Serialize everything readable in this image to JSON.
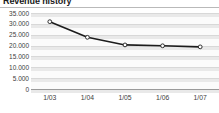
{
  "widget": {
    "title": "Revenue history"
  },
  "chart_data": {
    "type": "line",
    "title": "Revenue history",
    "xlabel": "",
    "ylabel": "",
    "categories": [
      "1/03",
      "1/04",
      "1/05",
      "1/06",
      "1/07"
    ],
    "values": [
      31000,
      23800,
      20300,
      19900,
      19400
    ],
    "series": [
      {
        "name": "Revenue",
        "values": [
          31000,
          23800,
          20300,
          19900,
          19400
        ],
        "line_color": "#1c1c1c",
        "marker": "circle",
        "marker_fill": "#ffffff",
        "marker_edge": "#1c1c1c"
      }
    ],
    "ylim": [
      0,
      35000
    ],
    "ytick_values": [
      35000,
      30000,
      25000,
      20000,
      15000,
      10000,
      5000,
      0
    ],
    "ytick_labels": [
      "35.000",
      "30.000",
      "25.000",
      "20.000",
      "15.000",
      "10.000",
      "5.000",
      "0"
    ],
    "xtick_labels": [
      "1/03",
      "1/04",
      "1/05",
      "1/06",
      "1/07"
    ],
    "grid": true,
    "grid_style": "horizontal-banded",
    "legend": false,
    "plot_background": "#fbfbfb",
    "grid_color": "#e9e9e9",
    "axis_color": "#9a9a9a",
    "text_color": "#3d3d3d"
  }
}
